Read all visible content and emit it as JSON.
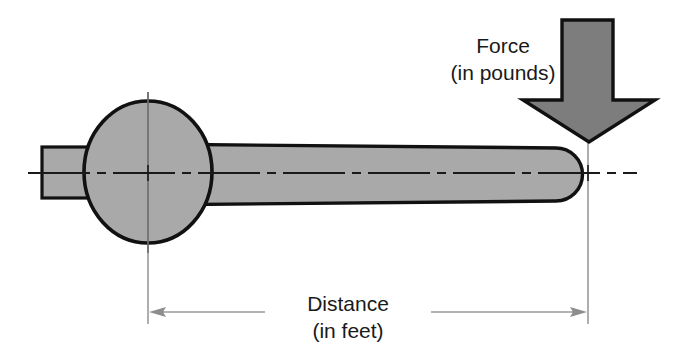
{
  "diagram": {
    "background_color": "#ffffff",
    "labels": {
      "force_line1": "Force",
      "force_line2": "(in pounds)",
      "distance_line1": "Distance",
      "distance_line2": "(in feet)"
    },
    "colors": {
      "body_fill": "#a9a9a9",
      "body_stroke": "#111111",
      "arrow_fill": "#7d7d7d",
      "arrow_stroke": "#111111",
      "centerline": "#1a1a1a",
      "dimension_line": "#8d8d8d",
      "text": "#1a1a1a"
    },
    "parts": [
      {
        "name": "square-drive-tab",
        "shape": "rectangle"
      },
      {
        "name": "wrench-head-circle",
        "shape": "ellipse"
      },
      {
        "name": "wrench-handle",
        "shape": "tapered-rounded-bar"
      },
      {
        "name": "force-arrow",
        "shape": "down-arrow"
      },
      {
        "name": "horizontal-centerline",
        "shape": "dash-dot-line"
      },
      {
        "name": "pivot-crosshair",
        "shape": "crosshair"
      },
      {
        "name": "force-point-crosshair",
        "shape": "crosshair"
      },
      {
        "name": "distance-dimension",
        "shape": "double-arrow-dimension"
      }
    ]
  }
}
